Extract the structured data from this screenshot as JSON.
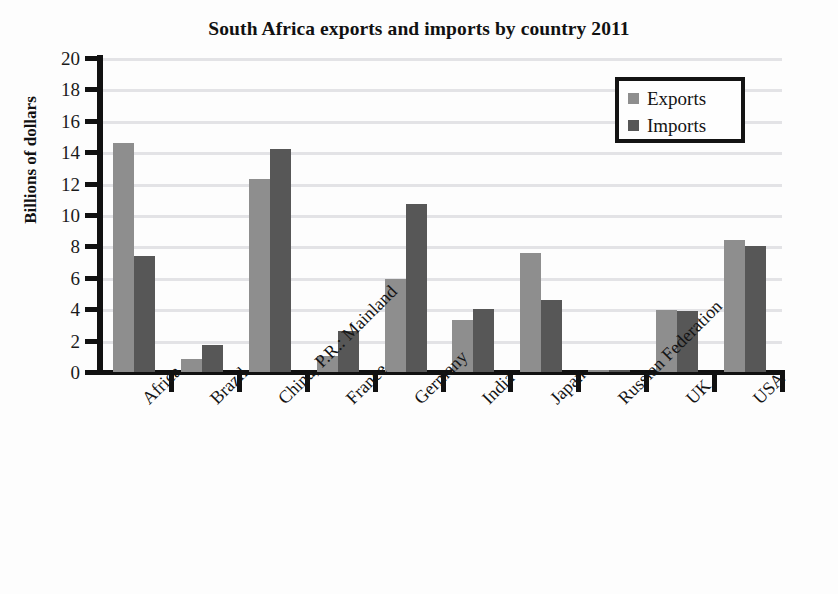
{
  "chart_data": {
    "type": "bar",
    "title": "South Africa exports and imports by country 2011",
    "xlabel": "",
    "ylabel": "Billions of dollars",
    "ylim": [
      0,
      20
    ],
    "ytick_step": 2,
    "yticks": [
      "20",
      "18",
      "16",
      "14",
      "12",
      "10",
      "8",
      "6",
      "4",
      "2",
      "0"
    ],
    "grid": true,
    "grid_orientation": "horizontal",
    "legend_position": "top-right",
    "categories": [
      "Africa",
      "Brazil",
      "China, P.R.: Mainland",
      "France",
      "Germany",
      "India",
      "Japan",
      "Russian Federation",
      "UK",
      "USA"
    ],
    "series": [
      {
        "name": "Exports",
        "color": "#8e8e8e",
        "values": [
          14.6,
          0.85,
          12.3,
          1.0,
          5.9,
          3.3,
          7.6,
          0.1,
          3.95,
          8.4
        ]
      },
      {
        "name": "Imports",
        "color": "#575757",
        "values": [
          7.4,
          1.7,
          14.2,
          2.6,
          10.7,
          4.0,
          4.6,
          0.1,
          3.9,
          8.0
        ]
      }
    ]
  },
  "legend": {
    "items": [
      {
        "label": "Exports",
        "color": "#8e8e8e"
      },
      {
        "label": "Imports",
        "color": "#575757"
      }
    ]
  },
  "colors": {
    "exports": "#8e8e8e",
    "imports": "#575757",
    "gridline": "#e3e3e6",
    "axis": "#111111",
    "background": "#fdfdfd"
  }
}
